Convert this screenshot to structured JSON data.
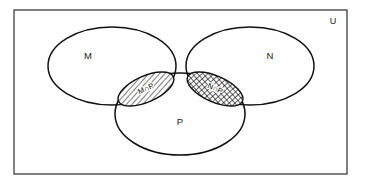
{
  "figure": {
    "kind": "venn-diagram",
    "width": 367,
    "height": 186,
    "background_color": "#ffffff",
    "stroke_color": "#111111",
    "frame_stroke_color": "#4a4a4a"
  },
  "universe": {
    "label": "U",
    "label_x": 333,
    "label_y": 22,
    "rect": {
      "x": 14,
      "y": 10,
      "width": 333,
      "height": 164
    }
  },
  "sets": [
    {
      "key": "M",
      "label": "M",
      "label_x": 88,
      "label_y": 56,
      "ellipse": {
        "cx": 112,
        "cy": 66,
        "rx": 64,
        "ry": 39
      }
    },
    {
      "key": "N",
      "label": "N",
      "label_x": 270,
      "label_y": 56,
      "ellipse": {
        "cx": 250,
        "cy": 66,
        "rx": 64,
        "ry": 39
      }
    },
    {
      "key": "P",
      "label": "P",
      "label_x": 180,
      "label_y": 122,
      "ellipse": {
        "cx": 180,
        "cy": 114,
        "rx": 65,
        "ry": 41
      }
    }
  ],
  "regions": [
    {
      "key": "M-and-P",
      "label": "M∩P",
      "fill_pattern": "diagonal-hatch",
      "label_x": 146,
      "label_y": 89,
      "rotation": -24,
      "lens": {
        "cx": 146,
        "cy": 89,
        "rx": 30,
        "ry": 13
      }
    },
    {
      "key": "N-and-P",
      "label": "N∩P",
      "fill_pattern": "cross-hatch",
      "label_x": 215,
      "label_y": 89,
      "rotation": 24,
      "lens": {
        "cx": 215,
        "cy": 89,
        "rx": 30,
        "ry": 13
      }
    }
  ]
}
